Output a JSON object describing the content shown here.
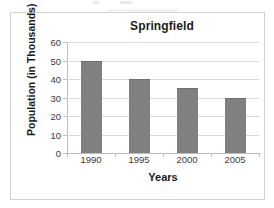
{
  "chart_data": {
    "type": "bar",
    "title": "Springfield",
    "xlabel": "Years",
    "ylabel": "Population (in Thousands)",
    "categories": [
      "1990",
      "1995",
      "2000",
      "2005"
    ],
    "values": [
      50,
      40,
      35,
      30
    ],
    "ylim": [
      0,
      60
    ],
    "ytick_labels": [
      "60",
      "50",
      "40",
      "30",
      "20",
      "10",
      "0"
    ],
    "ytick_values": [
      60,
      50,
      40,
      30,
      20,
      10,
      0
    ],
    "grid": true,
    "legend": null,
    "series": [
      {
        "name": "Population",
        "values": [
          50,
          40,
          35,
          30
        ]
      }
    ],
    "colors": {
      "bar": "#808080",
      "bar_edge": "#6f6f6f",
      "gridline": "#d9d9d9",
      "axis": "#bdbdbd",
      "frame": "#d2d2d2",
      "text": "#1b1b1b",
      "tick_text": "#3a3a3a",
      "background": "#ffffff"
    }
  }
}
